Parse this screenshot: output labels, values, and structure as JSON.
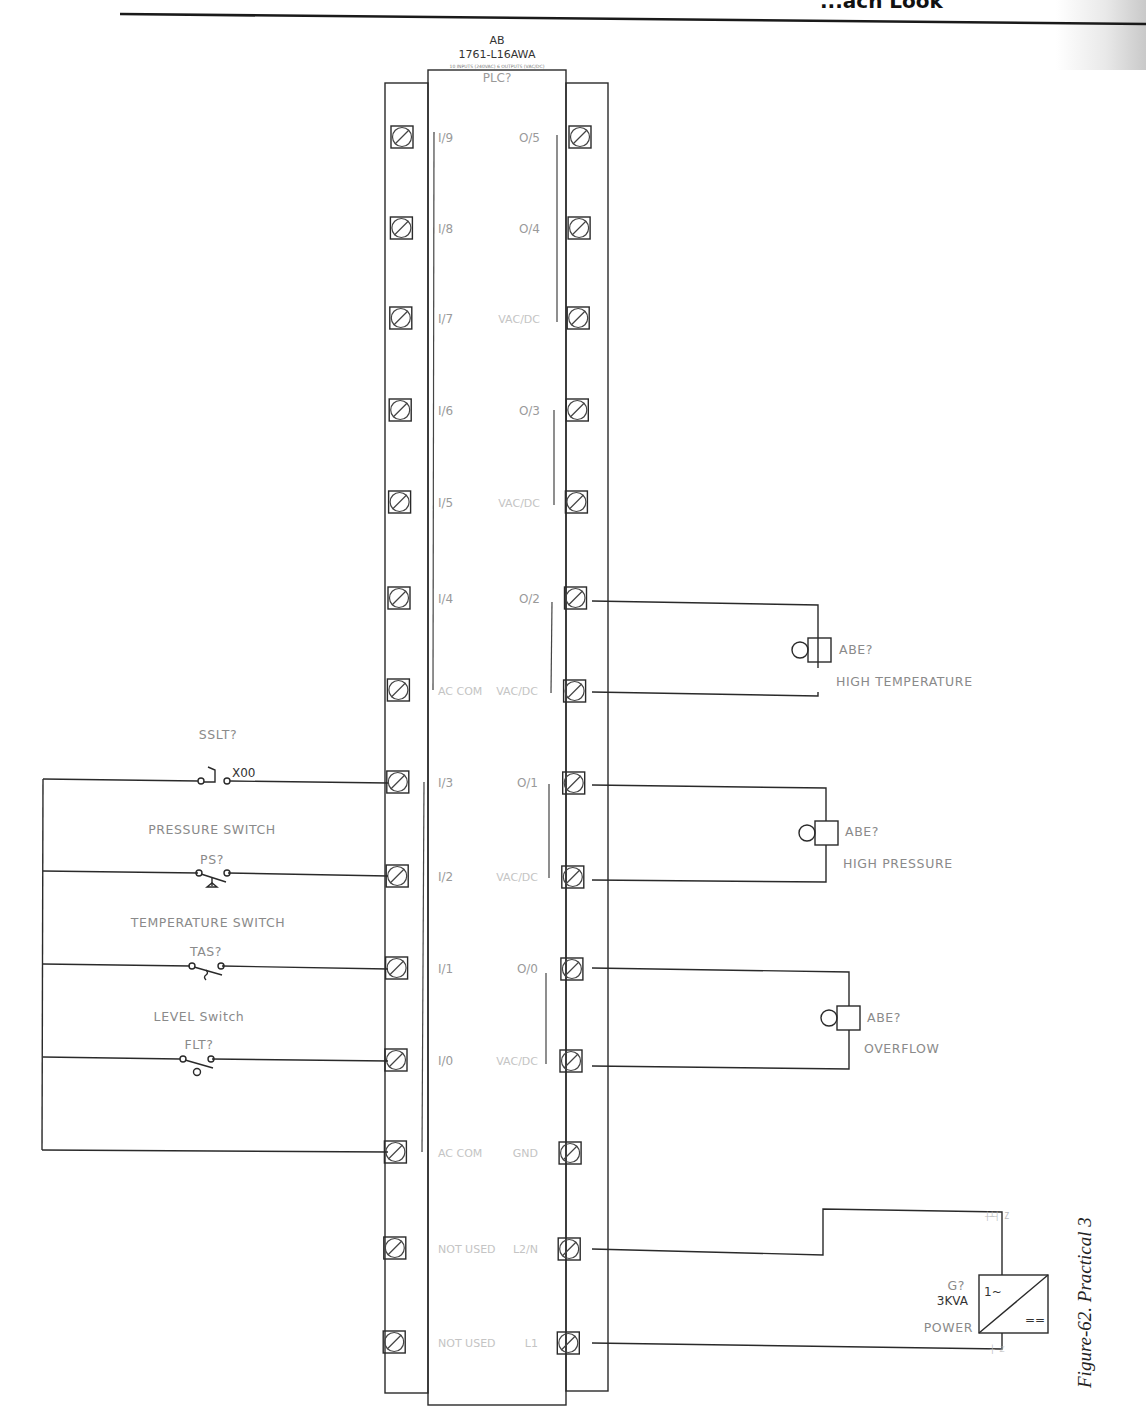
{
  "page": {
    "header_fragment": "...ach Look",
    "caption": "Figure-62. Practical 3"
  },
  "plc": {
    "brand": "AB",
    "model": "1761-L16AWA",
    "description": "10 INPUTS (240VAC) 6 OUTPUTS (VAC/DC)",
    "tag": "PLC?",
    "left_pins": [
      "I/9",
      "I/8",
      "I/7",
      "I/6",
      "I/5",
      "I/4",
      "AC COM",
      "I/3",
      "I/2",
      "I/1",
      "I/0",
      "AC COM",
      "NOT USED",
      "NOT USED"
    ],
    "right_pins": [
      "O/5",
      "O/4",
      "VAC/DC",
      "O/3",
      "VAC/DC",
      "O/2",
      "VAC/DC",
      "O/1",
      "VAC/DC",
      "O/0",
      "VAC/DC",
      "GND",
      "L2/N",
      "L1"
    ]
  },
  "inputs": [
    {
      "title": "SSLT?",
      "tag": "X00",
      "type": "selector-switch",
      "terminal": "I/3"
    },
    {
      "title": "PRESSURE SWITCH",
      "tag": "PS?",
      "type": "pressure-switch",
      "terminal": "I/2"
    },
    {
      "title": "TEMPERATURE SWITCH",
      "tag": "TAS?",
      "type": "temperature-switch",
      "terminal": "I/1"
    },
    {
      "title": "LEVEL Switch",
      "tag": "FLT?",
      "type": "level-switch",
      "terminal": "I/0"
    }
  ],
  "outputs": [
    {
      "tag": "ABE?",
      "label": "HIGH TEMPERATURE",
      "terminals": [
        "O/2",
        "VAC/DC"
      ]
    },
    {
      "tag": "ABE?",
      "label": "HIGH PRESSURE",
      "terminals": [
        "O/1",
        "VAC/DC"
      ]
    },
    {
      "tag": "ABE?",
      "label": "OVERFLOW",
      "terminals": [
        "O/0",
        "VAC/DC"
      ]
    }
  ],
  "power_supply": {
    "tag": "G?",
    "rating": "3KVA",
    "label": "POWER",
    "ac_symbol": "1~",
    "dc_symbol": "==",
    "terminals": [
      "L2/N",
      "L1"
    ]
  }
}
